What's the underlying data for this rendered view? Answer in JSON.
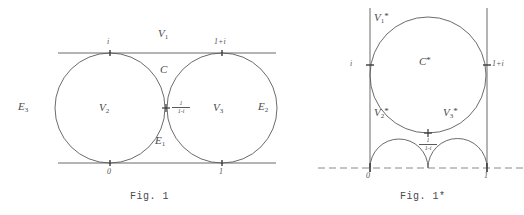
{
  "figures": [
    {
      "id": "fig1",
      "caption": "Fig. 1",
      "labels": {
        "v1": "V",
        "v1_sub": "1",
        "v2": "V",
        "v2_sub": "2",
        "v3": "V",
        "v3_sub": "3",
        "e1": "E",
        "e1_sub": "1",
        "e2": "E",
        "e2_sub": "2",
        "e3": "E",
        "e3_sub": "3",
        "c": "C",
        "tick_i": "i",
        "tick_1pi": "1+i",
        "tick_0": "0",
        "tick_1": "1",
        "tangent_num": "1",
        "tangent_den": "1-i"
      },
      "geometry": {
        "top_line_y": 53,
        "bottom_line_y": 163,
        "circle_radius": 55,
        "circle1_cx": 110,
        "circle2_cx": 222,
        "circle_cy": 108,
        "tangent_point_x": 166,
        "tangent_point_y": 108
      }
    },
    {
      "id": "fig1star",
      "caption": "Fig. 1*",
      "labels": {
        "v1": "V",
        "v1_sub": "1",
        "v1_star": "*",
        "v2": "V",
        "v2_sub": "2",
        "v2_star": "*",
        "v3": "V",
        "v3_sub": "3",
        "v3_star": "*",
        "c": "C",
        "c_star": "*",
        "tick_i": "i",
        "tick_1pi": "1+i",
        "tick_0": "0",
        "tick_1": "1",
        "tangent_num": "1",
        "tangent_den": "1-i"
      },
      "geometry": {
        "left_line_x": 370,
        "right_line_x": 487,
        "baseline_y": 168,
        "big_circle_cx": 428,
        "big_circle_cy": 75,
        "big_circle_r": 58,
        "small_radius": 29,
        "tangent_point_x": 428,
        "tangent_point_y": 133
      }
    }
  ],
  "style": {
    "ink": "#4a4a4a",
    "line": "#5a5a5a",
    "background": "#ffffff"
  }
}
